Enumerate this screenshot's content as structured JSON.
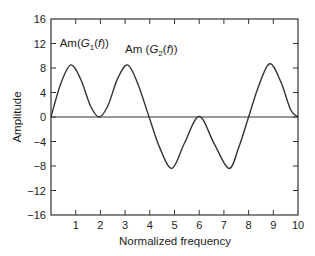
{
  "chart_data": {
    "type": "line",
    "title": "",
    "xlabel": "Normalized frequency",
    "ylabel": "Amplitude",
    "xlim": [
      0,
      10
    ],
    "ylim": [
      -16,
      16
    ],
    "x_ticks": [
      1,
      2,
      3,
      4,
      5,
      6,
      7,
      8,
      9,
      10
    ],
    "y_ticks": [
      16,
      12,
      8,
      4,
      0,
      -4,
      -8,
      -12,
      -16
    ],
    "grid": false,
    "legend": null,
    "annotations": [
      {
        "text": "Am(G",
        "sub": "1",
        "tail": "(f))",
        "x": 0.35,
        "y": 11.4
      },
      {
        "text": "Am (G",
        "sub": "2",
        "tail": "(f))",
        "x": 3.0,
        "y": 10.5
      }
    ],
    "series": [
      {
        "name": "Amplitude spectrum",
        "x": [
          0,
          0.4,
          0.8,
          1.2,
          1.6,
          1.95,
          2.3,
          2.7,
          3.1,
          3.5,
          3.97,
          4.4,
          4.9,
          5.4,
          6.0,
          6.6,
          7.2,
          7.6,
          8.0,
          8.4,
          8.85,
          9.3,
          9.7,
          10
        ],
        "values": [
          0,
          5.5,
          8.5,
          6.2,
          1.8,
          0,
          1.8,
          6.3,
          8.5,
          5.6,
          0,
          -5.0,
          -8.4,
          -4.3,
          0.1,
          -4.3,
          -8.4,
          -5.0,
          0,
          5.0,
          8.7,
          5.8,
          1.2,
          0
        ]
      }
    ],
    "zero_line": true
  }
}
